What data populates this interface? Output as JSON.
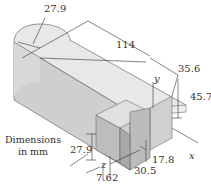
{
  "diagram": {
    "type": "isometric-part-drawing",
    "units_note": [
      "Dimensions",
      "in mm"
    ],
    "dimensions": {
      "radius_end": "27.9",
      "length": "114",
      "width_block": "35.6",
      "height_block": "45.7",
      "slot_height": "27.9",
      "offset_z": "7.62",
      "slot_width": "30.5",
      "wall": "17.8"
    },
    "axes": {
      "x": "x",
      "y": "y",
      "z": "z"
    },
    "colors": {
      "top_face": "#e6e6e6",
      "side_face": "#cfcfcf",
      "front_face": "#bdbdbd",
      "dark_face": "#a8a8a8",
      "line": "#333333"
    }
  }
}
